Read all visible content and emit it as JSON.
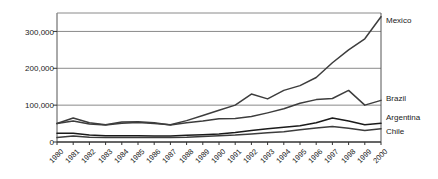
{
  "chart_data": {
    "type": "line",
    "title": "",
    "xlabel": "",
    "ylabel": "",
    "ylim": [
      0,
      350000
    ],
    "yticks": [
      0,
      100000,
      200000,
      300000
    ],
    "ytick_labels": [
      "0",
      "100,000",
      "200,000",
      "300,000"
    ],
    "grid": true,
    "legend_position": "right-inline-labels",
    "categories": [
      "1980",
      "1981",
      "1982",
      "1983",
      "1984",
      "1985",
      "1986",
      "1987",
      "1988",
      "1989",
      "1990",
      "1991",
      "1992",
      "1993",
      "1994",
      "1995",
      "1996",
      "1997",
      "1998",
      "1999",
      "2000"
    ],
    "series": [
      {
        "name": "Mexico",
        "color": "#3d3d3d",
        "values": [
          50000,
          57000,
          49000,
          46000,
          51000,
          53000,
          50000,
          47000,
          58000,
          72000,
          86000,
          100000,
          130000,
          117000,
          140000,
          153000,
          175000,
          215000,
          250000,
          280000,
          340000
        ]
      },
      {
        "name": "Brazil",
        "color": "#3d3d3d",
        "values": [
          50000,
          65000,
          52000,
          47000,
          54000,
          55000,
          52000,
          46000,
          52000,
          57000,
          63000,
          64000,
          69000,
          79000,
          90000,
          105000,
          115000,
          118000,
          140000,
          100000,
          113000
        ]
      },
      {
        "name": "Argentina",
        "color": "#1a1a1a",
        "values": [
          24000,
          24000,
          19000,
          17000,
          17000,
          17000,
          16000,
          16000,
          18000,
          20000,
          22000,
          26000,
          31000,
          36000,
          40000,
          44000,
          52000,
          65000,
          57000,
          47000,
          51000
        ]
      },
      {
        "name": "Chile",
        "color": "#3d3d3d",
        "values": [
          12000,
          16000,
          13000,
          12000,
          12000,
          12000,
          12000,
          12000,
          13000,
          15000,
          17000,
          19000,
          22000,
          25000,
          28000,
          33000,
          38000,
          42000,
          37000,
          31000,
          36000
        ]
      }
    ]
  },
  "axes": {
    "y_tick_labels": [
      "300,000",
      "200,000",
      "100,000",
      "0"
    ],
    "x_tick_labels": [
      "1980",
      "1981",
      "1982",
      "1983",
      "1984",
      "1985",
      "1986",
      "1987",
      "1988",
      "1989",
      "1990",
      "1991",
      "1992",
      "1993",
      "1994",
      "1995",
      "1996",
      "1997",
      "1998",
      "1999",
      "2000"
    ]
  },
  "series_labels": [
    {
      "name": "Mexico"
    },
    {
      "name": "Brazil"
    },
    {
      "name": "Argentina"
    },
    {
      "name": "Chile"
    }
  ],
  "style": {
    "plot_border_color": "#555555",
    "gridline_color": "#8a8a8a",
    "line_color_primary": "#3d3d3d",
    "line_color_dark": "#1a1a1a",
    "background": "#ffffff",
    "text_color": "#1a1a1a"
  }
}
